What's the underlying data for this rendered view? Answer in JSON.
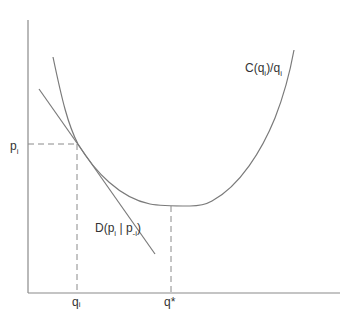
{
  "diagram": {
    "title": "",
    "colors": {
      "axis": "#8a8a8a",
      "curve": "#7a7a7a",
      "dashed": "#8a8a8a",
      "text": "#333333",
      "background": "#ffffff"
    },
    "labels": {
      "cost_curve": {
        "main": "C(q",
        "sub": "i",
        "tail": ")/q",
        "tail_sub": "i"
      },
      "demand_line": {
        "main": "D(p",
        "sub1": "i",
        "mid": " | p",
        "sub2": "-i",
        "tail": ")"
      },
      "y_tick_price": {
        "main": "p",
        "sub": "i"
      },
      "x_tick_qi": {
        "main": "q",
        "sub": "i"
      },
      "x_tick_qstar": "q*"
    },
    "elements": [
      "y-axis",
      "x-axis",
      "average cost curve C(q_i)/q_i (U-shaped)",
      "demand line D(p_i | p_-i) tangent to cost curve at (q_i, p_i)",
      "dashed guide from p_i to tangency",
      "dashed guide from q_i up to tangency",
      "dashed guide from q* up to curve minimum"
    ]
  }
}
